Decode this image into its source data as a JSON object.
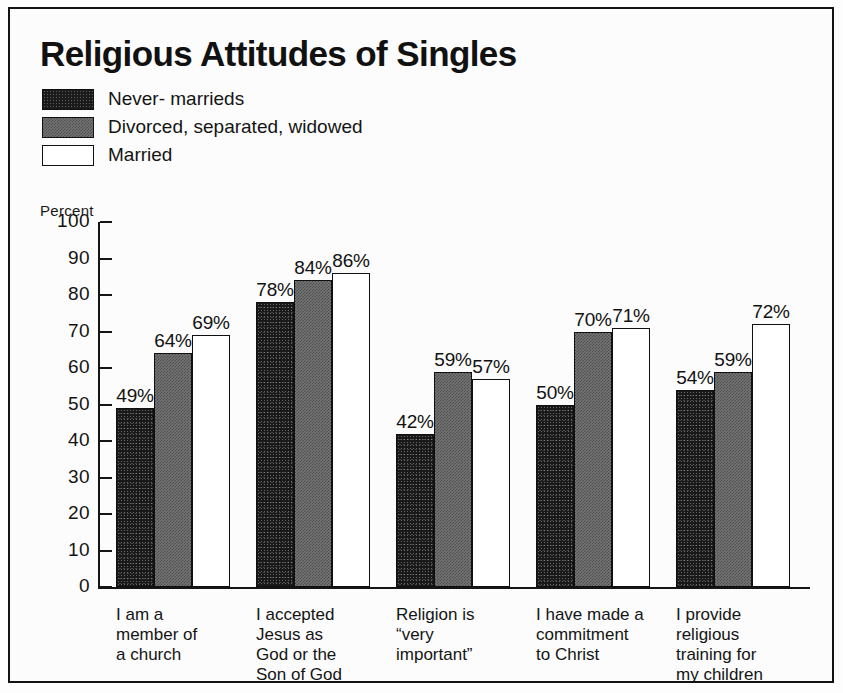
{
  "chart_data": {
    "type": "bar",
    "title": "Religious Attitudes of Singles",
    "xlabel": "",
    "ylabel": "Percent",
    "ylim": [
      0,
      100
    ],
    "ytick_step": 10,
    "yticks": [
      "100",
      "90",
      "80",
      "70",
      "60",
      "50",
      "40",
      "30",
      "20",
      "10",
      "0"
    ],
    "grid": false,
    "legend_position": "top-left",
    "value_suffix": "%",
    "categories": [
      "I am a\nmember of\na church",
      "I accepted\nJesus as\nGod or the\nSon of God",
      "Religion is\n“very\nimportant”",
      "I have made a\ncommitment\nto Christ",
      "I provide\nreligious\ntraining for\nmy children"
    ],
    "series": [
      {
        "name": "Never- marrieds",
        "key": "never",
        "color": "#191919",
        "values": [
          49,
          78,
          42,
          50,
          54
        ],
        "labels": [
          "49%",
          "78%",
          "42%",
          "50%",
          "54%"
        ]
      },
      {
        "name": "Divorced, separated, widowed",
        "key": "divorced",
        "color": "#767676",
        "values": [
          64,
          84,
          59,
          70,
          59
        ],
        "labels": [
          "64%",
          "84%",
          "59%",
          "70%",
          "59%"
        ]
      },
      {
        "name": "Married",
        "key": "married",
        "color": "#ffffff",
        "values": [
          69,
          86,
          57,
          71,
          72
        ],
        "labels": [
          "69%",
          "86%",
          "57%",
          "71%",
          "72%"
        ]
      }
    ]
  },
  "colors": {
    "frame": "#121212",
    "background": "#fcfcfc",
    "axis": "#151515",
    "text": "#141414"
  }
}
